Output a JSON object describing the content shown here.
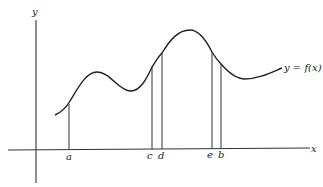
{
  "diagram": {
    "type": "function-graph",
    "axes": {
      "x_label": "x",
      "y_label": "y"
    },
    "curve": {
      "label": "y = f(x)"
    },
    "points_on_x_axis": [
      {
        "label": "a"
      },
      {
        "label": "c"
      },
      {
        "label": "d"
      },
      {
        "label": "e"
      },
      {
        "label": "b"
      }
    ]
  }
}
